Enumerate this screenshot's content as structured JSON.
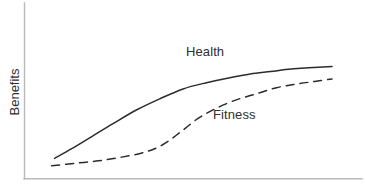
{
  "chart_data": {
    "type": "line",
    "title": "",
    "subtitle": "",
    "xlabel": "",
    "ylabel": "Benefits",
    "grid": false,
    "legend_position": "inline-annotations",
    "axes": {
      "x_axis_visible": true,
      "y_axis_visible": true,
      "x_tick_labels": [],
      "y_tick_labels": [],
      "xlim": [
        0,
        100
      ],
      "ylim": [
        0,
        100
      ]
    },
    "annotations": [
      {
        "text": "Health",
        "x": 55,
        "y": 76
      },
      {
        "text": "Fitness",
        "x": 63,
        "y": 42
      }
    ],
    "series": [
      {
        "name": "Health",
        "style": "solid",
        "color": "#2b2b2b",
        "x": [
          5,
          11,
          18,
          25,
          33,
          41,
          49,
          57,
          65,
          72,
          79,
          86,
          92,
          100
        ],
        "values": [
          11,
          19,
          29,
          39,
          50,
          59,
          67,
          72,
          76,
          79,
          81,
          83,
          84,
          85
        ]
      },
      {
        "name": "Fitness",
        "style": "dashed",
        "color": "#2b2b2b",
        "x": [
          4,
          12,
          20,
          28,
          36,
          42,
          48,
          54,
          60,
          67,
          74,
          81,
          88,
          94,
          100
        ],
        "values": [
          5,
          7,
          9,
          12,
          16,
          22,
          32,
          43,
          51,
          58,
          63,
          68,
          71,
          73,
          75
        ]
      }
    ]
  },
  "labels": {
    "ylabel": "Benefits",
    "health": "Health",
    "fitness": "Fitness"
  },
  "colors": {
    "line": "#2b2b2b",
    "axis": "#b9b9b9",
    "text": "#2f2f2f",
    "background": "#ffffff"
  }
}
